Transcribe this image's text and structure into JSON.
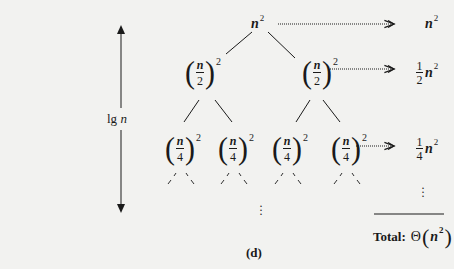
{
  "figure": {
    "caption": "(d)",
    "height_label": {
      "prefix": "lg",
      "var": "n"
    },
    "root": {
      "var": "n",
      "exp": "2"
    },
    "level1": [
      {
        "num": "n",
        "den": "2",
        "exp": "2"
      },
      {
        "num": "n",
        "den": "2",
        "exp": "2"
      }
    ],
    "level2": [
      {
        "num": "n",
        "den": "4",
        "exp": "2"
      },
      {
        "num": "n",
        "den": "4",
        "exp": "2"
      },
      {
        "num": "n",
        "den": "4",
        "exp": "2"
      },
      {
        "num": "n",
        "den": "4",
        "exp": "2"
      }
    ],
    "level_sums": [
      {
        "coef_num": "",
        "coef_den": "",
        "var": "n",
        "exp": "2"
      },
      {
        "coef_num": "1",
        "coef_den": "2",
        "var": "n",
        "exp": "2"
      },
      {
        "coef_num": "1",
        "coef_den": "4",
        "var": "n",
        "exp": "2"
      }
    ],
    "continuation": "⋮",
    "total": {
      "label": "Total:",
      "theta": "Θ",
      "open": "(",
      "var": "n",
      "exp": "2",
      "close": ")"
    }
  },
  "colors": {
    "ink": "#1a1a1a",
    "paper": "#f2f2f0"
  }
}
